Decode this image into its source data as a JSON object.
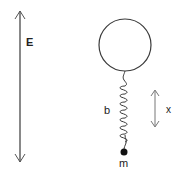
{
  "diagram": {
    "title": "",
    "labels": {
      "field": "E",
      "spring_constant": "b",
      "displacement": "x",
      "mass": "m"
    },
    "elements": [
      {
        "id": "field-arrow",
        "type": "double-arrow",
        "label": "E",
        "orientation": "vertical"
      },
      {
        "id": "balloon",
        "type": "circle"
      },
      {
        "id": "spring",
        "type": "coil-spring",
        "label": "b"
      },
      {
        "id": "mass",
        "type": "point-mass",
        "label": "m"
      },
      {
        "id": "displacement-arrow",
        "type": "double-arrow",
        "label": "x",
        "orientation": "vertical"
      }
    ],
    "colors": {
      "stroke": "#3a3a3a",
      "light_stroke": "#777777",
      "text": "#222222",
      "background": "#ffffff"
    }
  }
}
